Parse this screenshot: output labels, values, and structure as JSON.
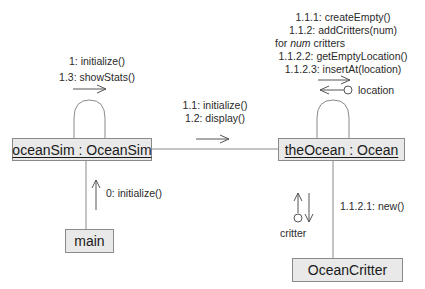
{
  "diagram": {
    "type": "uml-collaboration-diagram",
    "objects": {
      "ocean_sim": {
        "label": "oceanSim : OceanSim",
        "underlined": true
      },
      "the_ocean": {
        "label": "theOcean : Ocean",
        "underlined": true
      },
      "main": {
        "label": "main",
        "underlined": false
      },
      "ocean_critter": {
        "label": "OceanCritter",
        "underlined": false
      }
    },
    "messages": {
      "ocean_sim_self": [
        "1: initialize()",
        "1.3: showStats()"
      ],
      "sim_to_ocean": [
        "1.1: initialize()",
        "1.2: display()"
      ],
      "ocean_self": {
        "line1": "1.1.1: createEmpty()",
        "line2": "1.1.2: addCritters(num)",
        "loop_prefix": "for ",
        "loop_var": "num",
        "loop_suffix": " critters",
        "line4": "1.1.2.2: getEmptyLocation()",
        "line5": "1.1.2.3: insertAt(location)"
      },
      "return_location": "location",
      "main_to_sim": "0: initialize()",
      "ocean_to_critter": "1.1.2.1: new()",
      "return_critter": "critter"
    },
    "colors": {
      "box_fill": "#e9e9e9",
      "box_border": "#8a8a8a",
      "line": "#8a8a8a",
      "arrow": "#555555",
      "text": "#2a2a2a"
    }
  }
}
